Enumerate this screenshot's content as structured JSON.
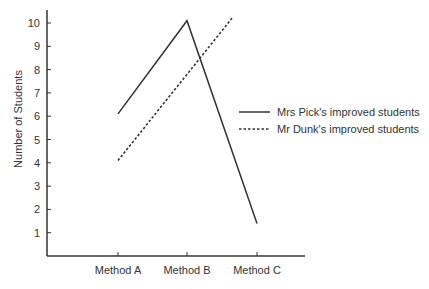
{
  "chart_data": {
    "type": "line",
    "title": "",
    "xlabel": "",
    "ylabel": "Number of Students",
    "categories": [
      "Method A",
      "Method B",
      "Method C"
    ],
    "yticks": [
      1,
      2,
      3,
      4,
      5,
      6,
      7,
      8,
      9,
      10
    ],
    "ylim": [
      0,
      10.5
    ],
    "grid": false,
    "legend_position": "right",
    "series": [
      {
        "name": "Mrs Pick's improved students",
        "style": "solid",
        "points": [
          {
            "x": "Method A",
            "y": 6.1
          },
          {
            "x": "Method B",
            "y": 10.1
          },
          {
            "x": "Method C",
            "y": 1.4
          }
        ]
      },
      {
        "name": "Mr Dunk's improved students",
        "style": "dashed",
        "points": [
          {
            "x": "Method A",
            "y": 4.1
          },
          {
            "x": "Method B",
            "y": 7.8
          },
          {
            "x": "between Method B and Method C",
            "y": 10.2
          }
        ]
      }
    ]
  },
  "colors": {
    "axis": "#333333",
    "line": "#333333",
    "text": "#333333",
    "background": "#ffffff"
  }
}
